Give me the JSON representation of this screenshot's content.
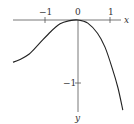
{
  "chart_data": {
    "type": "line",
    "title": "",
    "xlabel": "x",
    "ylabel": "y",
    "x_ticks": [
      "-1",
      "0",
      "1"
    ],
    "y_ticks": [
      "-1"
    ],
    "xlim": [
      -2.05,
      1.5
    ],
    "ylim": [
      -1.45,
      0.3
    ],
    "grid": false,
    "legend": null,
    "series": [
      {
        "name": "curve",
        "x": [
          -2.0,
          -1.8,
          -1.5,
          -1.2,
          -0.85,
          -0.55,
          -0.25,
          0.0,
          0.3,
          0.6,
          0.83,
          1.05,
          1.23,
          1.38
        ],
        "y": [
          -0.67,
          -0.63,
          -0.54,
          -0.38,
          -0.19,
          -0.06,
          -0.01,
          0.0,
          -0.05,
          -0.21,
          -0.43,
          -0.76,
          -1.08,
          -1.43
        ]
      }
    ]
  },
  "axes": {
    "x_label": "x",
    "y_label": "y",
    "tick_neg1_x": "−1",
    "tick_0": "0",
    "tick_1": "1",
    "tick_neg1_y": "−1"
  },
  "colors": {
    "axis": "#555555",
    "curve": "#222222",
    "text": "#333333",
    "background": "#ffffff"
  }
}
